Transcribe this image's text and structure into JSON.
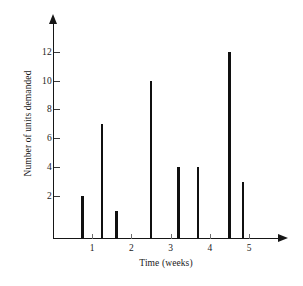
{
  "chart_data": {
    "type": "bar",
    "title": "",
    "xlabel": "Time (weeks)",
    "ylabel": "Number of units demanded",
    "xlim": [
      0,
      5.6
    ],
    "ylim": [
      0,
      13.5
    ],
    "grid": false,
    "legend": null,
    "x_ticks": [
      1,
      2,
      3,
      4,
      5
    ],
    "x_tick_labels": [
      "1",
      "2",
      "3",
      "4",
      "5"
    ],
    "y_ticks": [
      2,
      4,
      6,
      8,
      10,
      12
    ],
    "y_tick_labels": [
      "2",
      "4",
      "6",
      "8",
      "10",
      "12"
    ],
    "x": [
      0.75,
      1.25,
      1.62,
      2.5,
      3.2,
      3.7,
      4.5,
      4.85
    ],
    "values": [
      2,
      7,
      1,
      10,
      4,
      4,
      12,
      3
    ],
    "categories": [
      "0.75",
      "1.25",
      "1.62",
      "2.5",
      "3.2",
      "3.7",
      "4.5",
      "4.85"
    ],
    "series": [
      {
        "name": "Number of units demanded",
        "values": [
          2,
          7,
          1,
          10,
          4,
          4,
          12,
          3
        ]
      }
    ],
    "bar_color": "#101010",
    "axis_color": "#161616"
  },
  "axes": {
    "x_title": "Time (weeks)",
    "y_title": "Number of units demanded"
  },
  "caption": {
    "text": ""
  }
}
